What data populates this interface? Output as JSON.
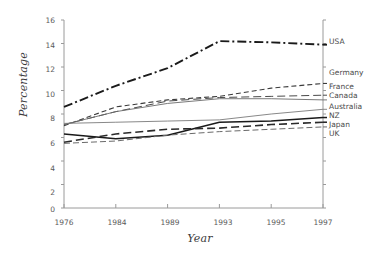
{
  "chart_data": {
    "type": "line",
    "title": "",
    "xlabel": "Year",
    "ylabel": "Percentage",
    "x": [
      1976,
      1984,
      1989,
      1993,
      1995,
      1997
    ],
    "xticklabels": [
      "1976",
      "1984",
      "1989",
      "1993",
      "1995",
      "1997"
    ],
    "yticklabels": [
      "0",
      "2",
      "4",
      "6",
      "8",
      "10",
      "12",
      "14",
      "16"
    ],
    "ylim": [
      0,
      16
    ],
    "ytick_step": 2,
    "grid": false,
    "legend_position": "right-outside",
    "series": [
      {
        "name": "USA",
        "values": [
          8.6,
          10.4,
          11.9,
          14.2,
          14.1,
          13.9
        ],
        "style": "dash-dot",
        "color": "#1a1a1a",
        "width": 1.9
      },
      {
        "name": "Germany",
        "values": [
          7.0,
          8.6,
          9.2,
          9.5,
          10.2,
          10.6
        ],
        "style": "dashed",
        "color": "#3a3a3a",
        "width": 1.1
      },
      {
        "name": "France",
        "values": [
          7.1,
          8.2,
          9.1,
          9.4,
          9.5,
          9.6
        ],
        "style": "dashed-long",
        "color": "#4a4a4a",
        "width": 1.0
      },
      {
        "name": "Canada",
        "values": [
          7.1,
          8.2,
          8.9,
          9.3,
          9.3,
          9.2
        ],
        "style": "solid",
        "color": "#6a6a6a",
        "width": 0.9
      },
      {
        "name": "Australia",
        "values": [
          7.2,
          7.3,
          7.4,
          7.5,
          8.0,
          8.4
        ],
        "style": "solid",
        "color": "#7a7a7a",
        "width": 0.9
      },
      {
        "name": "NZ",
        "values": [
          6.3,
          5.9,
          6.2,
          7.3,
          7.4,
          7.7
        ],
        "style": "solid-bold",
        "color": "#1a1a1a",
        "width": 1.5
      },
      {
        "name": "Japan",
        "values": [
          5.6,
          6.3,
          6.7,
          6.8,
          7.1,
          7.3
        ],
        "style": "dashed-long",
        "color": "#2a2a2a",
        "width": 1.6
      },
      {
        "name": "UK",
        "values": [
          5.5,
          5.7,
          6.2,
          6.5,
          6.7,
          6.9
        ],
        "style": "dashed-medium",
        "color": "#6a6a6a",
        "width": 1.0
      }
    ],
    "legend_labels": [
      "USA",
      "Germany",
      "France",
      "Canada",
      "Australia",
      "NZ",
      "Japan",
      "UK"
    ]
  }
}
